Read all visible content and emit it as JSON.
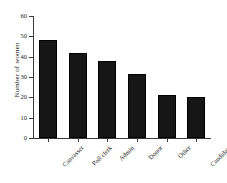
{
  "chart_data": {
    "type": "bar",
    "title": "",
    "subtitle": "",
    "xlabel": "",
    "ylabel": "Number of women",
    "categories": [
      "Canvasser",
      "Poll clerk",
      "Admin",
      "Donor",
      "Other",
      "Candidate"
    ],
    "values": [
      48,
      42,
      38,
      31.5,
      21,
      20
    ],
    "ylim": [
      0,
      60
    ],
    "yticks": [
      0,
      10,
      20,
      30,
      40,
      50,
      60
    ],
    "ytick_labels": [
      "0",
      "10",
      "20",
      "30",
      "40",
      "50",
      "60"
    ],
    "grid": false,
    "legend": null,
    "bar_color": "#161616",
    "axis_color": "#3a3a3a",
    "text_color": "#1a1a1a",
    "background_color": "#ffffff",
    "xtick_label_rotation": -45,
    "series": [
      {
        "name": "Number of women",
        "values": [
          48,
          42,
          38,
          31.5,
          21,
          20
        ]
      }
    ]
  }
}
